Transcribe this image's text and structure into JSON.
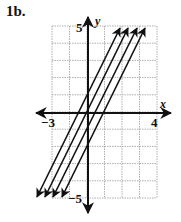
{
  "problem_label": "1b.",
  "graph": {
    "x_axis_label": "x",
    "y_axis_label": "y",
    "x_min_label": "−3",
    "x_max_label": "4",
    "y_max_label": "5",
    "y_min_label": "−5",
    "grid": {
      "left": 52,
      "right": 157,
      "top": 26,
      "bottom": 198,
      "cols": 6,
      "rows": 10
    },
    "line_color": "#111111",
    "grid_color": "#9a9a9a",
    "lines": [
      {
        "name": "line-1",
        "x1": 37,
        "y1": 197,
        "x2": 120,
        "y2": 28
      },
      {
        "name": "line-2",
        "x1": 45,
        "y1": 197,
        "x2": 128,
        "y2": 28
      },
      {
        "name": "line-3",
        "x1": 53,
        "y1": 197,
        "x2": 137,
        "y2": 28
      },
      {
        "name": "line-4",
        "x1": 62,
        "y1": 197,
        "x2": 145,
        "y2": 28
      }
    ]
  }
}
